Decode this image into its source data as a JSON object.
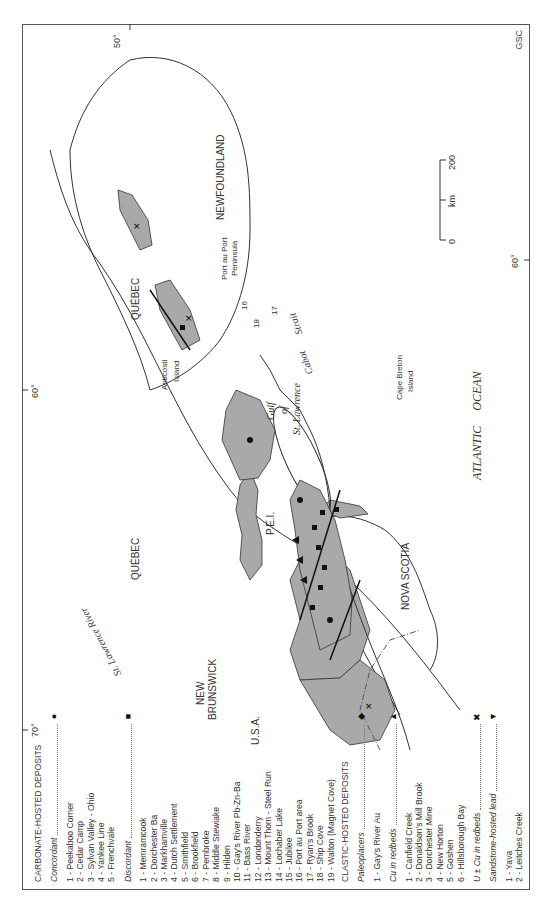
{
  "figure": {
    "credit": "GSC",
    "graticule": {
      "lon_70": "70°",
      "lon_60_top": "60°",
      "lon_60_bottom": "60°",
      "lat_50": "50°"
    },
    "scale_bar": {
      "min": "0",
      "mid_label": "km",
      "max": "200"
    }
  },
  "legend": {
    "carbonate": {
      "title": "CARBONATE-HOSTED DEPOSITS",
      "concordant": {
        "label": "Concordant",
        "symbol": "circle",
        "items": [
          "1 - Peekaboo Corner",
          "2 - Cedar Camp",
          "3 - Sylvan Valley - Ohio",
          "4 - Yankee Line",
          "5 - Frenchvale"
        ]
      },
      "discordant": {
        "label": "Discordant",
        "symbol": "square",
        "items": [
          "1 - Memramcook",
          "2 - Dorchester Ba",
          "3 - Markhamville",
          "4 - Dutch Settlement",
          "5 - Smithfield",
          "6 - Brookfield",
          "7 - Pembroke",
          "8 - Middle Stewiake",
          "9 - Hilden",
          "10 - Gay's River Pb-Zn-Ba",
          "11 - Bass River",
          "12 - Londonderry",
          "13 - Mount Thom - Steel Run",
          "14 - Lochaber Lake",
          "15 - Jubilee",
          "16 - Port au Port area",
          "17 - Ryan's Brook",
          "18 - Ship Cove",
          "19 - Walton (Magnet Cove)"
        ]
      }
    },
    "clastic": {
      "title": "CLASTIC-HOSTED DEPOSITS",
      "paleoplacers": {
        "label": "Paleoplacers",
        "symbol": "diamond",
        "items": [
          "1 - Gay's River Au"
        ]
      },
      "cu_redbeds": {
        "label": "Cu in redbeds",
        "symbol": "triangle-up",
        "items": [
          "1 - Canfield Creek",
          "2 - Donaldson's Mill Brook",
          "3 - Dorchester Mine",
          "4 - New Horton",
          "5 - Goshen",
          "6 - Hillsborough Bay"
        ]
      },
      "u_cu_redbeds": {
        "label": "U ± Cu in redbeds",
        "symbol": "cross"
      },
      "sandstone_lead": {
        "label": "Sandstone-hosted lead",
        "symbol": "triangle-down",
        "items": [
          "1 - Yava",
          "2 - Leitches Creek"
        ]
      }
    }
  },
  "map_labels": {
    "quebec_north": "QUÉBEC",
    "quebec_gaspe": "QUÉBEC",
    "anticosti": "Anticosti",
    "anticosti_2": "Island",
    "st_lawrence_river": "St. Lawrence River",
    "gulf_1": "Gulf",
    "gulf_2": "of",
    "gulf_3": "St. Lawrence",
    "newfoundland": "NEWFOUNDLAND",
    "port_au_port_1": "Port au Port",
    "port_au_port_2": "Peninsula",
    "cabot_1": "Cabot",
    "cabot_2": "Strait",
    "cape_breton_1": "Cape Breton",
    "cape_breton_2": "Island",
    "pei": "P.E.I.",
    "new_brunswick_1": "NEW",
    "new_brunswick_2": "BRUNSWICK",
    "usa": "U.S.A.",
    "nova_scotia": "NOVA SCOTIA",
    "atlantic": "ATLANTIC     OCEAN",
    "nf_16": "16",
    "nf_17": "17",
    "nf_18": "18",
    "fault_label": "LRF"
  },
  "colors": {
    "deposit_fill": "#a9a9a9",
    "outline": "#333333",
    "symbol": "#111111"
  }
}
